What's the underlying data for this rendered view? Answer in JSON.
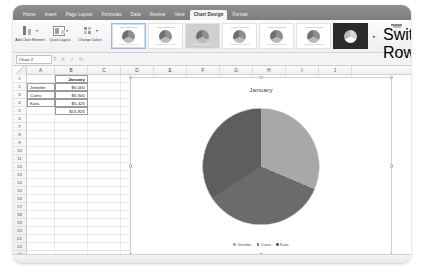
{
  "app": {
    "name": "Microsoft Excel",
    "name_box_value": "Chart 2",
    "formula_value": ""
  },
  "ribbon": {
    "tabs": [
      {
        "label": "Home",
        "active": false
      },
      {
        "label": "Insert",
        "active": false
      },
      {
        "label": "Page Layout",
        "active": false
      },
      {
        "label": "Formulas",
        "active": false
      },
      {
        "label": "Data",
        "active": false
      },
      {
        "label": "Review",
        "active": false
      },
      {
        "label": "View",
        "active": false
      },
      {
        "label": "Chart Design",
        "active": true
      },
      {
        "label": "Format",
        "active": false
      }
    ],
    "buttons": [
      {
        "label": "Add Chart Element",
        "icon": "add-chart-element-icon"
      },
      {
        "label": "Quick Layout",
        "icon": "quick-layout-icon"
      },
      {
        "label": "Change Colors",
        "icon": "change-colors-icon"
      }
    ],
    "gallery_label": "Chart Styles",
    "gallery_more": "▸",
    "switch_label": "Switch Row/Column"
  },
  "formula_bar": {
    "cancel_icon": "✕",
    "enter_icon": "✓",
    "function_icon": "fx"
  },
  "grid": {
    "columns": [
      "A",
      "B",
      "C",
      "D",
      "E",
      "F",
      "G",
      "H",
      "I",
      "J"
    ],
    "rows": [
      "1",
      "2",
      "3",
      "4",
      "5",
      "6",
      "7",
      "8",
      "9",
      "10",
      "11",
      "12",
      "13",
      "14",
      "15",
      "16",
      "17",
      "18",
      "19",
      "20",
      "21",
      "22",
      "23",
      "24"
    ],
    "cells": [
      {
        "row": 1,
        "col": "B",
        "value": "January",
        "style": "hdr"
      },
      {
        "row": 2,
        "col": "A",
        "value": "Jennifer",
        "style": "text"
      },
      {
        "row": 2,
        "col": "B",
        "value": "$5,000",
        "style": "num"
      },
      {
        "row": 3,
        "col": "A",
        "value": "Curtis",
        "style": "text"
      },
      {
        "row": 3,
        "col": "B",
        "value": "$5,500",
        "style": "num"
      },
      {
        "row": 4,
        "col": "A",
        "value": "Kara",
        "style": "text"
      },
      {
        "row": 4,
        "col": "B",
        "value": "$5,425",
        "style": "num"
      },
      {
        "row": 5,
        "col": "B",
        "value": "$15,925",
        "style": "num"
      }
    ]
  },
  "chart_data": {
    "type": "pie",
    "title": "January",
    "categories": [
      "Jennifer",
      "Curtis",
      "Kara"
    ],
    "values": [
      5000,
      5500,
      5425
    ],
    "value_labels": [
      "$5,000",
      "$5,500",
      "$5,425"
    ],
    "total": 15925,
    "total_label": "$15,925",
    "percentages": [
      31.4,
      34.5,
      34.1
    ],
    "colors": [
      "#a8a8a8",
      "#6b6b6b",
      "#5e5e5e"
    ],
    "legend": [
      "Jennifer",
      "Curtis",
      "Kara"
    ],
    "legend_position": "bottom",
    "xlabel": "",
    "ylabel": "",
    "grid": false,
    "selected": true
  },
  "status": {
    "zoom_text": "",
    "sheet_tab": ""
  }
}
